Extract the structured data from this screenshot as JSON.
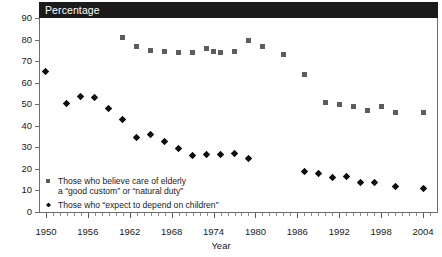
{
  "header": {
    "title": "Percentage"
  },
  "chart_data": {
    "type": "scatter",
    "title": "Percentage",
    "xlabel": "Year",
    "ylabel": "",
    "xlim": [
      1949,
      2006
    ],
    "ylim": [
      0,
      90
    ],
    "grid": false,
    "legend_position": "inside-bottom-left",
    "y_ticks": [
      0,
      10,
      20,
      30,
      40,
      50,
      60,
      70,
      80,
      90
    ],
    "x_ticks": [
      1950,
      1956,
      1962,
      1968,
      1974,
      1980,
      1986,
      1992,
      1998,
      2004
    ],
    "x_minor_tick_interval": 1,
    "series": [
      {
        "name": "Those who believe care of elderly a “good custom” or “natural duty”",
        "marker": "square",
        "color": "#5d5d5d",
        "points": [
          {
            "x": 1961,
            "y": 81
          },
          {
            "x": 1963,
            "y": 77
          },
          {
            "x": 1965,
            "y": 75
          },
          {
            "x": 1967,
            "y": 74.5
          },
          {
            "x": 1969,
            "y": 74
          },
          {
            "x": 1971,
            "y": 74
          },
          {
            "x": 1973,
            "y": 76
          },
          {
            "x": 1974,
            "y": 74.5
          },
          {
            "x": 1975,
            "y": 74
          },
          {
            "x": 1977,
            "y": 74.5
          },
          {
            "x": 1979,
            "y": 79.5
          },
          {
            "x": 1981,
            "y": 77
          },
          {
            "x": 1984,
            "y": 73
          },
          {
            "x": 1987,
            "y": 64
          },
          {
            "x": 1990,
            "y": 51
          },
          {
            "x": 1992,
            "y": 50
          },
          {
            "x": 1994,
            "y": 49
          },
          {
            "x": 1996,
            "y": 47
          },
          {
            "x": 1998,
            "y": 49
          },
          {
            "x": 2000,
            "y": 46
          },
          {
            "x": 2004,
            "y": 46
          }
        ]
      },
      {
        "name": "Those who “expect to depend on children”",
        "marker": "diamond",
        "color": "#101010",
        "points": [
          {
            "x": 1950,
            "y": 65
          },
          {
            "x": 1953,
            "y": 50.5
          },
          {
            "x": 1955,
            "y": 53.5
          },
          {
            "x": 1957,
            "y": 53
          },
          {
            "x": 1959,
            "y": 48
          },
          {
            "x": 1961,
            "y": 43
          },
          {
            "x": 1963,
            "y": 34.5
          },
          {
            "x": 1965,
            "y": 36
          },
          {
            "x": 1967,
            "y": 32.5
          },
          {
            "x": 1969,
            "y": 29.5
          },
          {
            "x": 1971,
            "y": 26
          },
          {
            "x": 1973,
            "y": 26.5
          },
          {
            "x": 1975,
            "y": 26.5
          },
          {
            "x": 1977,
            "y": 27
          },
          {
            "x": 1979,
            "y": 25
          },
          {
            "x": 1987,
            "y": 19
          },
          {
            "x": 1989,
            "y": 18
          },
          {
            "x": 1991,
            "y": 16
          },
          {
            "x": 1993,
            "y": 16.5
          },
          {
            "x": 1995,
            "y": 13.5
          },
          {
            "x": 1997,
            "y": 13.5
          },
          {
            "x": 2000,
            "y": 12
          },
          {
            "x": 2004,
            "y": 11
          }
        ]
      }
    ]
  },
  "legend": {
    "item1_line1": "Those who believe care of elderly",
    "item1_line2": "a “good custom” or “natural duty”",
    "item2_line1": "Those who “expect to depend on children”"
  },
  "axes": {
    "x_title": "Year"
  }
}
